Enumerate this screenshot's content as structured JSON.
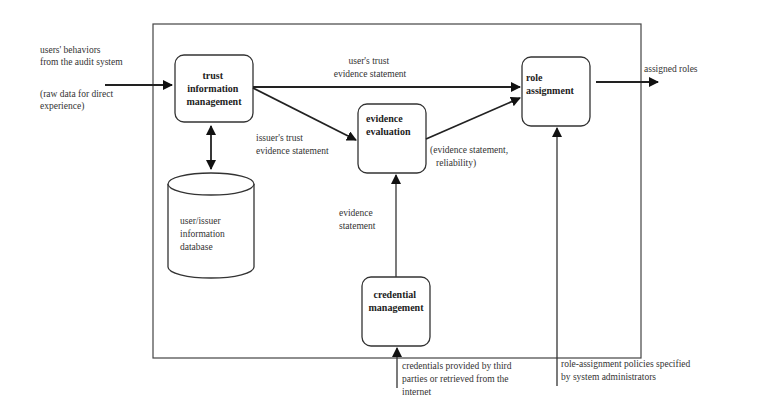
{
  "diagram": {
    "nodes": {
      "trust": {
        "lines": [
          "trust",
          "information",
          "management"
        ]
      },
      "evidence": {
        "lines": [
          "evidence",
          "evaluation"
        ]
      },
      "role": {
        "lines": [
          "role",
          "assignment"
        ]
      },
      "credential": {
        "lines": [
          "credential",
          "management"
        ]
      },
      "database": {
        "lines": [
          "user/issuer",
          "information",
          "database"
        ]
      }
    },
    "labels": {
      "input_behaviors": [
        "users' behaviors",
        "from the audit system"
      ],
      "input_raw": [
        "(raw data for direct",
        "experience)"
      ],
      "user_trust": [
        "user's trust",
        "evidence statement"
      ],
      "issuer_trust": [
        "issuer's trust",
        "evidence statement"
      ],
      "eval_output": [
        "(evidence statement,",
        "reliability)"
      ],
      "evidence_statement": [
        "evidence",
        "statement"
      ],
      "assigned_roles": "assigned roles",
      "credentials_input": [
        "credentials provided by third",
        "parties or retrieved from the",
        "internet"
      ],
      "policies_input": [
        "role-assignment policies specified",
        "by system administrators"
      ]
    },
    "edges": [
      {
        "from": "audit system",
        "to": "trust information management"
      },
      {
        "from": "trust information management",
        "to": "role assignment",
        "label": "user's trust evidence statement"
      },
      {
        "from": "trust information management",
        "to": "evidence evaluation",
        "label": "issuer's trust evidence statement"
      },
      {
        "from": "evidence evaluation",
        "to": "role assignment",
        "label": "(evidence statement, reliability)"
      },
      {
        "from": "credential management",
        "to": "evidence evaluation",
        "label": "evidence statement"
      },
      {
        "from": "trust information management",
        "to": "user/issuer information database",
        "bidirectional": true
      },
      {
        "from": "role assignment",
        "to": "output",
        "label": "assigned roles"
      },
      {
        "from": "third parties / internet",
        "to": "credential management"
      },
      {
        "from": "system administrators",
        "to": "role assignment"
      }
    ]
  }
}
